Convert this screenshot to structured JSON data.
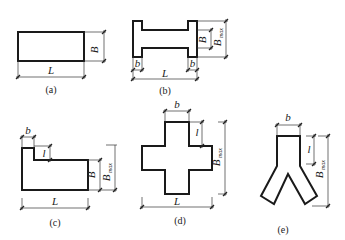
{
  "figures": [
    {
      "id": "a",
      "caption": "(a)",
      "shape": "rectangle",
      "labels": {
        "L": "L",
        "B": "B"
      }
    },
    {
      "id": "b",
      "caption": "(b)",
      "shape": "I-shape (dumbbell)",
      "labels": {
        "L": "L",
        "B": "B",
        "Bmax": "B",
        "Bmax_sub": "max",
        "b_left": "b",
        "b_right": "b"
      }
    },
    {
      "id": "c",
      "caption": "(c)",
      "shape": "L-shape with notch",
      "labels": {
        "L": "L",
        "B": "B",
        "Bmax": "B",
        "Bmax_sub": "max",
        "b": "b",
        "l": "l"
      }
    },
    {
      "id": "d",
      "caption": "(d)",
      "shape": "cross",
      "labels": {
        "L": "L",
        "Bmax": "B",
        "Bmax_sub": "max",
        "b": "b",
        "l": "l"
      }
    },
    {
      "id": "e",
      "caption": "(e)",
      "shape": "Y-shape",
      "labels": {
        "Bmax": "B",
        "Bmax_sub": "max",
        "b": "b",
        "l": "l"
      }
    }
  ]
}
